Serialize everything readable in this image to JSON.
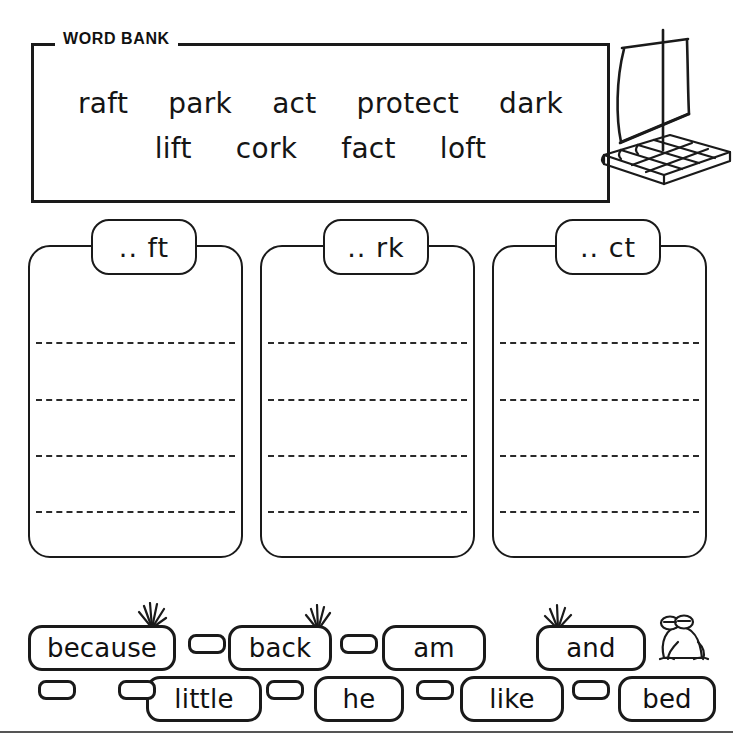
{
  "word_bank": {
    "title": "WORD BANK",
    "rows": [
      [
        "raft",
        "park",
        "act",
        "protect",
        "dark"
      ],
      [
        "lift",
        "cork",
        "fact",
        "loft"
      ]
    ]
  },
  "illustration": {
    "raft": "raft-illustration",
    "frog": "frog-illustration",
    "grass": "grass-tuft-icon"
  },
  "sort_boxes": [
    {
      "label": ".. ft",
      "lines": 4
    },
    {
      "label": ".. rk",
      "lines": 4
    },
    {
      "label": ".. ct",
      "lines": 4
    }
  ],
  "sight_words": {
    "top_row": [
      "because",
      "back",
      "am",
      "and"
    ],
    "bottom_row": [
      "little",
      "he",
      "like",
      "bed"
    ],
    "blank_stones": 7
  },
  "colors": {
    "ink": "#1a1a1a",
    "paper": "#ffffff",
    "dash": "#2a2a2a",
    "rule": "#555555"
  }
}
